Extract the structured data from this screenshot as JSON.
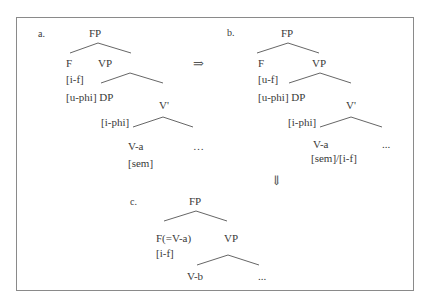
{
  "figure": {
    "panels": {
      "a": {
        "label": "a.",
        "root": "FP",
        "f_head": "F",
        "f_feature": "[i-f]",
        "vp": "VP",
        "dp": "[u-phi] DP",
        "vbar": "V'",
        "vbar_feature": "[i-phi]",
        "verb": "V-a",
        "verb_feature": "[sem]",
        "ellipsis": "…"
      },
      "b": {
        "label": "b.",
        "root": "FP",
        "f_head": "F",
        "f_feature": "[u-f]",
        "vp": "VP",
        "dp": "[u-phi] DP",
        "vbar": "V'",
        "vbar_feature": "[i-phi]",
        "verb": "V-a",
        "verb_feature": "[sem]/[i-f]",
        "ellipsis": "..."
      },
      "c": {
        "label": "c.",
        "root": "FP",
        "f_head": "F(=V-a)",
        "f_feature": "[i-f]",
        "vp": "VP",
        "verb": "V-b",
        "ellipsis": "..."
      }
    },
    "arrows": {
      "a_to_b": "⇒",
      "b_to_c": "⇓"
    }
  }
}
